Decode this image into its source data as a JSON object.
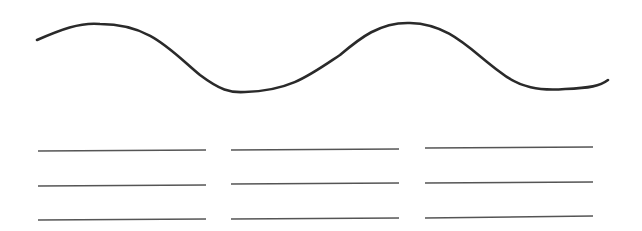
{
  "worksheet": {
    "background": "#ffffff",
    "stroke_color": "#2a2a2a",
    "line_color": "#555555",
    "wave": {
      "path": "M37,40 C60,30 80,22 100,24 C150,24 170,50 200,75 C220,90 230,93 245,92 C290,91 310,75 340,55 C360,38 380,22 410,23 C450,24 470,50 500,72 C520,88 540,91 565,89 C590,88 600,86 608,80",
      "stroke_width": 2.6
    },
    "answer_lines": [
      {
        "column": 1,
        "row": 1,
        "x1": 38,
        "y1": 151,
        "x2": 206,
        "y2": 150
      },
      {
        "column": 1,
        "row": 2,
        "x1": 38,
        "y1": 186,
        "x2": 206,
        "y2": 185
      },
      {
        "column": 1,
        "row": 3,
        "x1": 38,
        "y1": 220,
        "x2": 206,
        "y2": 219
      },
      {
        "column": 2,
        "row": 1,
        "x1": 231,
        "y1": 150,
        "x2": 399,
        "y2": 149
      },
      {
        "column": 2,
        "row": 2,
        "x1": 231,
        "y1": 184,
        "x2": 399,
        "y2": 183
      },
      {
        "column": 2,
        "row": 3,
        "x1": 231,
        "y1": 219,
        "x2": 399,
        "y2": 218
      },
      {
        "column": 3,
        "row": 1,
        "x1": 425,
        "y1": 148,
        "x2": 593,
        "y2": 147
      },
      {
        "column": 3,
        "row": 2,
        "x1": 425,
        "y1": 183,
        "x2": 593,
        "y2": 182
      },
      {
        "column": 3,
        "row": 3,
        "x1": 425,
        "y1": 218,
        "x2": 593,
        "y2": 216
      }
    ]
  }
}
